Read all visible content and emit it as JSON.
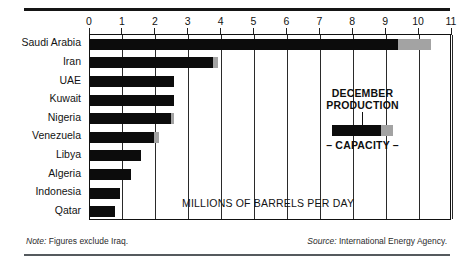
{
  "chart_data": {
    "type": "bar",
    "orientation": "horizontal",
    "title": "",
    "subtitle": "",
    "xlabel": "MILLIONS OF BARRELS PER DAY",
    "ylabel": "",
    "xlim": [
      0,
      11
    ],
    "xticks": [
      0,
      1,
      2,
      3,
      4,
      5,
      6,
      7,
      8,
      9,
      10,
      11
    ],
    "xticklabels": [
      "0",
      "1",
      "2",
      "3",
      "4",
      "5",
      "6",
      "7",
      "8",
      "9",
      "10",
      "11"
    ],
    "grid": "vertical",
    "legend_position": "inside-right",
    "categories": [
      "Saudi Arabia",
      "Iran",
      "UAE",
      "Kuwait",
      "Nigeria",
      "Venezuela",
      "Libya",
      "Algeria",
      "Indonesia",
      "Qatar"
    ],
    "series": [
      {
        "name": "DECEMBER PRODUCTION",
        "color": "#0c0c0c",
        "values": [
          9.35,
          3.75,
          2.55,
          2.55,
          2.45,
          1.95,
          1.55,
          1.25,
          0.9,
          0.75
        ]
      },
      {
        "name": "CAPACITY",
        "color": "#a3a3a3",
        "values": [
          10.35,
          3.9,
          2.55,
          2.55,
          2.55,
          2.1,
          1.55,
          1.25,
          0.9,
          0.75
        ]
      }
    ]
  },
  "legend": {
    "title_line1": "DECEMBER",
    "title_line2": "PRODUCTION",
    "capacity_label": "– CAPACITY –"
  },
  "footer": {
    "note_lead": "Note:",
    "note_text": " Figures exclude Iraq.",
    "source_lead": "Source:",
    "source_text": " International Energy Agency."
  }
}
